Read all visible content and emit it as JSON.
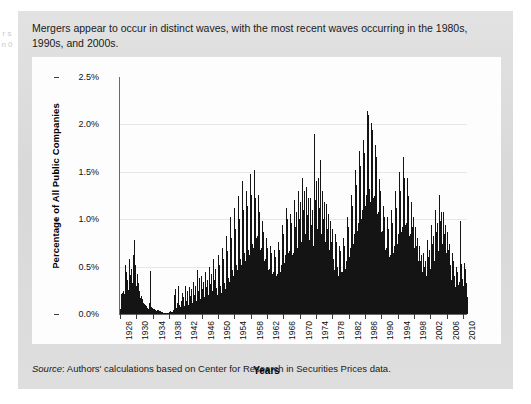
{
  "margin_bleed": "r s n 0",
  "caption": "Mergers appear to occur in distinct waves, with the most recent waves occurring in the 1980s, 1990s, and 2000s.",
  "source_label": "Source",
  "source_text": ": Authors' calculations based on Center for Research in Securities Prices data.",
  "colors": {
    "panel": "#dcdcdc",
    "plot_background": "#fdfdfd",
    "bar": "#141414",
    "axis": "#6a6a6a",
    "grid": "#e7e7e7",
    "text": "#1a1a1a"
  },
  "chart_data": {
    "type": "bar",
    "title": "Mergers appear to occur in distinct waves, with the most recent waves occurring in the 1980s, 1990s, and 2000s.",
    "xlabel": "Years",
    "ylabel": "Percentage of All Public Companies",
    "ylim": [
      0,
      2.5
    ],
    "yticks": [
      0.0,
      0.5,
      1.0,
      1.5,
      2.0,
      2.5
    ],
    "ytick_labels": [
      "0.0%",
      "0.5%",
      "1.0%",
      "1.5%",
      "2.0%",
      "2.5%"
    ],
    "xlim": [
      1926,
      2011
    ],
    "xticks": [
      1926,
      1930,
      1934,
      1938,
      1942,
      1946,
      1950,
      1954,
      1958,
      1962,
      1966,
      1970,
      1974,
      1978,
      1982,
      1986,
      1990,
      1994,
      1998,
      2002,
      2006,
      2010
    ],
    "xtick_labels": [
      "1926",
      "1930",
      "1934",
      "1938",
      "1942",
      "1946",
      "1950",
      "1954",
      "1958",
      "1962",
      "1966",
      "1970",
      "1974",
      "1978",
      "1982",
      "1986",
      "1990",
      "1994",
      "1998",
      "2002",
      "2006",
      "2010"
    ],
    "grid": "horizontal",
    "legend": "none",
    "value_unit": "percent",
    "frequency": "monthly",
    "series_name": "Percentage of all public companies acquired",
    "x_start": 1926,
    "x_step": 0.08333,
    "values": [
      0.0,
      0.05,
      0.21,
      0.1,
      0.16,
      0.07,
      0.22,
      0.11,
      0.19,
      0.24,
      0.12,
      0.21,
      0.09,
      0.18,
      0.52,
      0.23,
      0.31,
      0.14,
      0.44,
      0.2,
      0.17,
      0.36,
      0.13,
      0.25,
      0.21,
      0.11,
      0.58,
      0.3,
      0.18,
      0.15,
      0.41,
      0.22,
      0.19,
      0.48,
      0.24,
      0.33,
      0.3,
      0.22,
      0.5,
      0.45,
      0.62,
      0.78,
      0.55,
      0.4,
      0.34,
      0.52,
      0.28,
      0.3,
      0.22,
      0.18,
      0.42,
      0.26,
      0.31,
      0.2,
      0.33,
      0.19,
      0.24,
      0.15,
      0.17,
      0.12,
      0.1,
      0.08,
      0.19,
      0.11,
      0.14,
      0.09,
      0.16,
      0.1,
      0.12,
      0.08,
      0.11,
      0.07,
      0.06,
      0.04,
      0.09,
      0.05,
      0.07,
      0.04,
      0.08,
      0.05,
      0.06,
      0.04,
      0.05,
      0.03,
      0.05,
      0.03,
      0.12,
      0.06,
      0.45,
      0.3,
      0.08,
      0.05,
      0.07,
      0.04,
      0.06,
      0.04,
      0.03,
      0.02,
      0.05,
      0.03,
      0.04,
      0.02,
      0.05,
      0.03,
      0.04,
      0.02,
      0.03,
      0.02,
      0.02,
      0.01,
      0.04,
      0.02,
      0.03,
      0.02,
      0.04,
      0.02,
      0.03,
      0.02,
      0.03,
      0.01,
      0.0,
      0.0,
      0.02,
      0.01,
      0.01,
      0.0,
      0.02,
      0.01,
      0.01,
      0.0,
      0.01,
      0.0,
      0.0,
      0.0,
      0.01,
      0.0,
      0.01,
      0.0,
      0.01,
      0.0,
      0.01,
      0.0,
      0.01,
      0.0,
      0.01,
      0.0,
      0.02,
      0.01,
      0.02,
      0.01,
      0.03,
      0.01,
      0.02,
      0.01,
      0.02,
      0.01,
      0.02,
      0.01,
      0.04,
      0.02,
      0.2,
      0.08,
      0.05,
      0.03,
      0.26,
      0.1,
      0.06,
      0.04,
      0.05,
      0.03,
      0.12,
      0.06,
      0.3,
      0.12,
      0.08,
      0.05,
      0.09,
      0.04,
      0.07,
      0.04,
      0.06,
      0.04,
      0.14,
      0.07,
      0.22,
      0.1,
      0.08,
      0.05,
      0.18,
      0.08,
      0.07,
      0.05,
      0.08,
      0.05,
      0.3,
      0.14,
      0.12,
      0.07,
      0.24,
      0.11,
      0.09,
      0.06,
      0.1,
      0.06,
      0.09,
      0.05,
      0.28,
      0.13,
      0.19,
      0.09,
      0.26,
      0.12,
      0.11,
      0.07,
      0.12,
      0.07,
      0.1,
      0.06,
      0.34,
      0.16,
      0.2,
      0.1,
      0.3,
      0.14,
      0.13,
      0.08,
      0.14,
      0.08,
      0.12,
      0.07,
      0.46,
      0.2,
      0.24,
      0.12,
      0.38,
      0.17,
      0.15,
      0.09,
      0.16,
      0.09,
      0.13,
      0.08,
      0.4,
      0.18,
      0.26,
      0.13,
      0.34,
      0.16,
      0.17,
      0.1,
      0.18,
      0.1,
      0.14,
      0.09,
      0.44,
      0.2,
      0.28,
      0.14,
      0.36,
      0.17,
      0.19,
      0.11,
      0.2,
      0.11,
      0.16,
      0.1,
      0.5,
      0.23,
      0.32,
      0.16,
      0.42,
      0.2,
      0.22,
      0.13,
      0.24,
      0.13,
      0.18,
      0.11,
      0.58,
      0.26,
      0.36,
      0.18,
      0.48,
      0.22,
      0.25,
      0.15,
      0.27,
      0.15,
      0.2,
      0.12,
      0.62,
      0.28,
      0.4,
      0.2,
      0.52,
      0.24,
      0.28,
      0.16,
      0.3,
      0.16,
      0.22,
      0.14,
      0.7,
      0.32,
      0.44,
      0.22,
      0.58,
      0.27,
      0.31,
      0.18,
      0.33,
      0.18,
      0.26,
      0.16,
      0.82,
      0.38,
      0.52,
      0.26,
      0.66,
      0.31,
      0.36,
      0.21,
      0.38,
      0.21,
      0.34,
      0.2,
      1.02,
      0.46,
      0.64,
      0.32,
      0.8,
      0.38,
      0.44,
      0.26,
      0.46,
      0.26,
      0.4,
      0.24,
      1.12,
      0.52,
      0.72,
      0.36,
      0.9,
      0.42,
      0.5,
      0.29,
      0.52,
      0.29,
      0.46,
      0.28,
      1.24,
      0.58,
      0.8,
      0.4,
      1.0,
      0.47,
      0.56,
      0.33,
      0.58,
      0.33,
      0.52,
      0.32,
      1.4,
      0.64,
      0.88,
      0.44,
      1.1,
      0.52,
      0.62,
      0.36,
      0.64,
      0.36,
      0.56,
      0.34,
      1.3,
      0.62,
      0.92,
      0.46,
      1.14,
      0.54,
      0.66,
      0.38,
      0.68,
      0.38,
      0.62,
      0.38,
      1.48,
      0.7,
      1.02,
      0.5,
      1.26,
      0.58,
      0.72,
      0.42,
      0.74,
      0.42,
      0.7,
      0.42,
      1.52,
      1.1,
      1.42,
      0.72,
      1.22,
      0.62,
      0.8,
      0.46,
      0.82,
      0.46,
      0.66,
      0.4,
      1.26,
      0.6,
      0.96,
      0.48,
      1.08,
      0.52,
      0.68,
      0.4,
      0.7,
      0.4,
      0.54,
      0.33,
      0.98,
      0.48,
      0.76,
      0.38,
      0.86,
      0.42,
      0.56,
      0.33,
      0.58,
      0.33,
      0.44,
      0.27,
      0.8,
      0.4,
      0.62,
      0.32,
      0.7,
      0.35,
      0.46,
      0.28,
      0.48,
      0.28,
      0.4,
      0.25,
      0.72,
      0.36,
      0.56,
      0.29,
      0.64,
      0.32,
      0.42,
      0.26,
      0.44,
      0.26,
      0.38,
      0.24,
      0.68,
      0.34,
      0.52,
      0.28,
      0.6,
      0.3,
      0.4,
      0.25,
      0.42,
      0.25,
      0.42,
      0.26,
      0.76,
      0.38,
      0.58,
      0.3,
      0.68,
      0.34,
      0.44,
      0.27,
      0.46,
      0.27,
      0.52,
      0.32,
      0.94,
      0.46,
      0.72,
      0.37,
      0.84,
      0.41,
      0.54,
      0.32,
      0.56,
      0.32,
      0.62,
      0.38,
      1.12,
      0.54,
      0.86,
      0.44,
      1.0,
      0.48,
      0.64,
      0.38,
      0.66,
      0.38,
      0.58,
      0.36,
      1.06,
      0.52,
      0.82,
      0.42,
      0.96,
      0.46,
      0.62,
      0.36,
      0.64,
      0.36,
      0.66,
      0.4,
      1.2,
      0.58,
      0.92,
      0.47,
      1.08,
      0.52,
      0.68,
      0.4,
      0.7,
      0.4,
      0.72,
      0.44,
      1.3,
      0.62,
      1.0,
      0.51,
      1.18,
      0.56,
      0.74,
      0.43,
      0.76,
      0.43,
      0.8,
      0.48,
      1.44,
      0.68,
      1.1,
      0.56,
      1.3,
      0.62,
      0.82,
      0.47,
      0.84,
      0.47,
      0.74,
      0.45,
      1.34,
      0.64,
      1.04,
      0.53,
      1.22,
      0.58,
      0.76,
      0.44,
      0.78,
      0.44,
      0.68,
      0.42,
      1.22,
      0.59,
      0.94,
      0.48,
      1.1,
      0.53,
      0.7,
      0.41,
      0.72,
      0.41,
      0.86,
      0.52,
      1.9,
      0.74,
      1.2,
      0.6,
      1.4,
      0.66,
      0.88,
      0.5,
      0.9,
      0.5,
      0.8,
      0.49,
      1.44,
      0.69,
      1.12,
      0.57,
      1.62,
      0.62,
      0.82,
      0.48,
      0.84,
      0.48,
      0.72,
      0.44,
      1.3,
      0.62,
      1.0,
      0.51,
      1.18,
      0.56,
      0.74,
      0.43,
      0.76,
      0.43,
      0.64,
      0.4,
      1.16,
      0.56,
      0.9,
      0.46,
      1.06,
      0.5,
      0.66,
      0.39,
      0.68,
      0.39,
      0.54,
      0.34,
      0.98,
      0.48,
      0.76,
      0.39,
      0.9,
      0.43,
      0.56,
      0.33,
      0.58,
      0.33,
      0.46,
      0.29,
      0.84,
      0.41,
      0.64,
      0.33,
      0.76,
      0.36,
      0.48,
      0.28,
      0.5,
      0.28,
      0.4,
      0.25,
      0.72,
      0.36,
      0.56,
      0.29,
      0.66,
      0.32,
      0.42,
      0.25,
      0.44,
      0.25,
      0.44,
      0.28,
      0.8,
      0.39,
      0.62,
      0.32,
      0.72,
      0.35,
      0.46,
      0.27,
      0.48,
      0.27,
      0.56,
      0.35,
      1.02,
      0.49,
      0.78,
      0.4,
      0.92,
      0.44,
      0.58,
      0.34,
      0.6,
      0.34,
      0.7,
      0.43,
      1.26,
      0.6,
      0.98,
      0.5,
      1.14,
      0.54,
      0.72,
      0.42,
      0.74,
      0.42,
      0.84,
      0.51,
      1.52,
      0.72,
      1.16,
      0.59,
      1.36,
      0.64,
      0.86,
      0.5,
      0.88,
      0.5,
      0.96,
      0.58,
      1.72,
      0.82,
      1.32,
      0.67,
      1.56,
      0.73,
      0.98,
      0.56,
      1.0,
      0.56,
      1.1,
      0.66,
      1.84,
      1.38,
      1.62,
      0.9,
      1.7,
      0.84,
      1.12,
      0.64,
      1.14,
      0.64,
      1.26,
      0.76,
      2.14,
      1.42,
      1.96,
      1.04,
      2.1,
      1.08,
      1.3,
      0.74,
      1.32,
      0.74,
      1.18,
      0.72,
      2.02,
      1.3,
      1.82,
      0.96,
      1.94,
      0.98,
      1.22,
      0.7,
      1.24,
      0.7,
      1.04,
      0.63,
      1.78,
      1.12,
      1.54,
      0.82,
      1.66,
      0.86,
      1.06,
      0.61,
      1.08,
      0.61,
      0.84,
      0.51,
      1.42,
      0.84,
      1.2,
      0.64,
      1.3,
      0.68,
      0.86,
      0.5,
      0.88,
      0.5,
      0.66,
      0.41,
      1.14,
      0.62,
      0.94,
      0.5,
      1.02,
      0.52,
      0.68,
      0.4,
      0.7,
      0.4,
      0.58,
      0.36,
      1.02,
      0.54,
      0.82,
      0.44,
      0.9,
      0.46,
      0.6,
      0.35,
      0.62,
      0.35,
      0.62,
      0.38,
      1.1,
      0.58,
      0.88,
      0.47,
      0.96,
      0.49,
      0.64,
      0.37,
      0.66,
      0.37,
      0.72,
      0.44,
      1.3,
      0.66,
      1.02,
      0.54,
      1.12,
      0.56,
      0.74,
      0.43,
      0.76,
      0.43,
      0.84,
      0.51,
      1.5,
      0.76,
      1.18,
      0.62,
      1.3,
      0.64,
      0.86,
      0.5,
      0.88,
      0.5,
      0.92,
      0.56,
      1.66,
      0.84,
      1.3,
      0.68,
      1.44,
      0.7,
      0.94,
      0.54,
      0.96,
      0.54,
      0.8,
      0.49,
      1.44,
      0.73,
      1.12,
      0.59,
      1.24,
      0.61,
      0.82,
      0.47,
      0.84,
      0.47,
      0.66,
      0.41,
      1.18,
      0.6,
      0.92,
      0.49,
      1.02,
      0.51,
      0.68,
      0.39,
      0.7,
      0.39,
      0.52,
      0.32,
      0.92,
      0.47,
      0.72,
      0.38,
      0.8,
      0.4,
      0.54,
      0.31,
      0.56,
      0.31,
      0.4,
      0.25,
      0.72,
      0.37,
      0.56,
      0.3,
      0.62,
      0.31,
      0.42,
      0.24,
      0.44,
      0.24,
      0.36,
      0.22,
      0.64,
      0.33,
      0.5,
      0.27,
      0.56,
      0.28,
      0.38,
      0.22,
      0.4,
      0.22,
      0.44,
      0.27,
      0.78,
      0.4,
      0.6,
      0.32,
      0.68,
      0.34,
      0.46,
      0.26,
      0.48,
      0.26,
      0.52,
      0.32,
      0.94,
      0.48,
      0.74,
      0.39,
      0.82,
      0.41,
      0.54,
      0.31,
      0.56,
      0.31,
      0.62,
      0.38,
      1.1,
      0.56,
      0.86,
      0.46,
      0.96,
      0.48,
      0.64,
      0.37,
      0.66,
      0.37,
      0.7,
      0.43,
      1.26,
      0.64,
      0.98,
      0.52,
      1.08,
      0.54,
      0.72,
      0.41,
      0.74,
      0.41,
      0.6,
      0.37,
      1.08,
      0.55,
      0.84,
      0.45,
      0.94,
      0.46,
      0.62,
      0.36,
      0.64,
      0.36,
      0.48,
      0.3,
      0.86,
      0.44,
      0.68,
      0.36,
      0.74,
      0.37,
      0.5,
      0.29,
      0.52,
      0.29,
      0.36,
      0.22,
      0.64,
      0.33,
      0.5,
      0.27,
      0.56,
      0.28,
      0.38,
      0.22,
      0.4,
      0.22,
      0.28,
      0.17,
      0.5,
      0.26,
      0.39,
      0.21,
      0.44,
      0.22,
      0.3,
      0.17,
      0.31,
      0.17,
      0.34,
      0.21,
      0.98,
      0.31,
      0.47,
      0.25,
      0.53,
      0.26,
      0.36,
      0.21,
      0.37,
      0.21,
      0.3,
      0.18,
      0.54,
      0.28,
      0.42,
      0.22,
      0.47,
      0.23,
      0.32,
      0.18,
      0.33,
      0.18
    ],
    "annotations": [
      {
        "label": "1920s wave peak",
        "year": 1929,
        "value": 0.78
      },
      {
        "label": "1960s wave peak",
        "year": 1968,
        "value": 1.52
      },
      {
        "label": "1980s wave peak",
        "year": 1986,
        "value": 1.9
      },
      {
        "label": "1990s wave peak",
        "year": 1998,
        "value": 2.14
      }
    ]
  }
}
